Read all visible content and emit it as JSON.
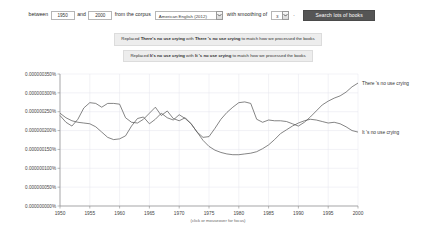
{
  "toolbar": {
    "between_label": "between",
    "year_start": "1950",
    "and_label": "and",
    "year_end": "2000",
    "corpus_label": "from the corpus",
    "corpus_value": "American English (2012)",
    "smoothing_label": "with smoothing of",
    "smoothing_value": "3",
    "period_label": ".",
    "search_label": "Search lots of books",
    "dropdown_icon": "chevron-down-icon"
  },
  "notices": [
    {
      "prefix": "Replaced ",
      "original": "There's no use crying",
      "middle": " with ",
      "replacement": "There 's no use crying",
      "suffix": " to match how we processed the books"
    },
    {
      "prefix": "Replaced ",
      "original": "It's no use crying",
      "middle": " with ",
      "replacement": "It 's no use crying",
      "suffix": " to match how we processed the books"
    }
  ],
  "chart_data": {
    "type": "line",
    "title": "",
    "xlabel": "(click or mouseover for focus)",
    "ylabel": "",
    "xlim": [
      1950,
      2000
    ],
    "ylim": [
      0,
      3.5e-06
    ],
    "grid": true,
    "legend_position": "right-inline",
    "xticks": [
      1950,
      1955,
      1960,
      1965,
      1970,
      1975,
      1980,
      1985,
      1990,
      1995,
      2000
    ],
    "xtick_labels": [
      "1950",
      "1955",
      "1960",
      "1965",
      "1970",
      "1975",
      "1980",
      "1985",
      "1990",
      "1995",
      "2000"
    ],
    "yticks": [
      0,
      5e-07,
      1e-06,
      1.5e-06,
      2e-06,
      2.5e-06,
      3e-06,
      3.5e-06
    ],
    "ytick_labels": [
      "0.000000000%",
      "0.000000050%",
      "0.000000100%",
      "0.000000150%",
      "0.000000200%",
      "0.000000250%",
      "0.000000300%",
      "0.000000350%"
    ],
    "x": [
      1950,
      1951,
      1952,
      1953,
      1954,
      1955,
      1956,
      1957,
      1958,
      1959,
      1960,
      1961,
      1962,
      1963,
      1964,
      1965,
      1966,
      1967,
      1968,
      1969,
      1970,
      1971,
      1972,
      1973,
      1974,
      1975,
      1976,
      1977,
      1978,
      1979,
      1980,
      1981,
      1982,
      1983,
      1984,
      1985,
      1986,
      1987,
      1988,
      1989,
      1990,
      1991,
      1992,
      1993,
      1994,
      1995,
      1996,
      1997,
      1998,
      1999,
      2000
    ],
    "series": [
      {
        "name": "There 's no use crying",
        "color": "#5c5c5c",
        "values": [
          2.4e-06,
          2.22e-06,
          2.12e-06,
          2.3e-06,
          2.6e-06,
          2.74e-06,
          2.72e-06,
          2.62e-06,
          2.72e-06,
          2.72e-06,
          2.7e-06,
          2.34e-06,
          2.22e-06,
          2.2e-06,
          2.3e-06,
          2.46e-06,
          2.62e-06,
          2.4e-06,
          2.52e-06,
          2.32e-06,
          2.26e-06,
          2.34e-06,
          2.18e-06,
          1.96e-06,
          1.82e-06,
          1.84e-06,
          2.06e-06,
          2.3e-06,
          2.48e-06,
          2.62e-06,
          2.74e-06,
          2.76e-06,
          2.72e-06,
          2.3e-06,
          2.22e-06,
          2.28e-06,
          2.26e-06,
          2.26e-06,
          2.24e-06,
          2.18e-06,
          2.12e-06,
          2.22e-06,
          2.36e-06,
          2.52e-06,
          2.68e-06,
          2.78e-06,
          2.86e-06,
          2.92e-06,
          3.02e-06,
          3.16e-06,
          3.26e-06
        ],
        "label_x": 2000,
        "label_y": 3.26e-06
      },
      {
        "name": "It 's no use crying",
        "color": "#5c5c5c",
        "values": [
          2.46e-06,
          2.34e-06,
          2.26e-06,
          2.22e-06,
          2.2e-06,
          2.18e-06,
          2.1e-06,
          1.96e-06,
          1.82e-06,
          1.76e-06,
          1.78e-06,
          1.86e-06,
          2.12e-06,
          2.32e-06,
          2.36e-06,
          2.18e-06,
          2.3e-06,
          2.46e-06,
          2.34e-06,
          2.28e-06,
          2.42e-06,
          2.32e-06,
          2.18e-06,
          1.96e-06,
          1.74e-06,
          1.58e-06,
          1.48e-06,
          1.42e-06,
          1.38e-06,
          1.36e-06,
          1.36e-06,
          1.38e-06,
          1.4e-06,
          1.44e-06,
          1.52e-06,
          1.62e-06,
          1.76e-06,
          1.92e-06,
          2.02e-06,
          2.12e-06,
          2.2e-06,
          2.26e-06,
          2.3e-06,
          2.28e-06,
          2.24e-06,
          2.2e-06,
          2.22e-06,
          2.18e-06,
          2.1e-06,
          2e-06,
          1.96e-06
        ],
        "label_x": 2000,
        "label_y": 1.96e-06
      }
    ]
  }
}
